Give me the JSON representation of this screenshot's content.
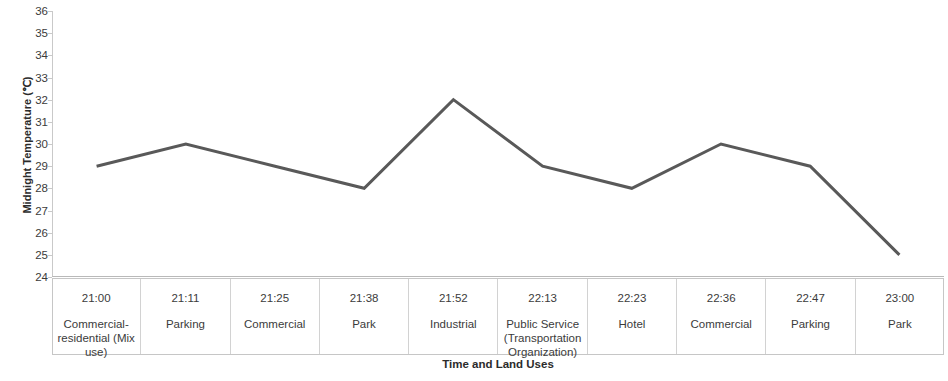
{
  "chart_data": {
    "type": "line",
    "title": "",
    "xlabel": "Time  and Land Uses",
    "ylabel": "Midnight Temperature (℃)",
    "ylim": [
      24,
      36
    ],
    "ytick_step": 1,
    "grid": false,
    "legend": "none",
    "line_color": "#595959",
    "line_width": 3,
    "categories": [
      "21:00",
      "21:11",
      "21:25",
      "21:38",
      "21:52",
      "22:13",
      "22:23",
      "22:36",
      "22:47",
      "23:00"
    ],
    "category_sublabels": [
      "Commercial-residential (Mix use)",
      "Parking",
      "Commercial",
      "Park",
      "Industrial",
      "Public Service (Transportation Organization)",
      "Hotel",
      "Commercial",
      "Parking",
      "Park"
    ],
    "values": [
      29,
      30,
      29,
      28,
      32,
      29,
      28,
      30,
      29,
      25
    ],
    "yticks": [
      "36",
      "35",
      "34",
      "33",
      "32",
      "31",
      "30",
      "29",
      "28",
      "27",
      "26",
      "25",
      "24"
    ]
  },
  "axis": {
    "y_title": "Midnight Temperature (℃)",
    "x_title": "Time  and Land Uses"
  },
  "table": {
    "rows": [
      {
        "time": "21:00",
        "land_use": "Commercial-residential (Mix use)"
      },
      {
        "time": "21:11",
        "land_use": "Parking"
      },
      {
        "time": "21:25",
        "land_use": "Commercial"
      },
      {
        "time": "21:38",
        "land_use": "Park"
      },
      {
        "time": "21:52",
        "land_use": "Industrial"
      },
      {
        "time": "22:13",
        "land_use": "Public Service (Transportation Organization)"
      },
      {
        "time": "22:23",
        "land_use": "Hotel"
      },
      {
        "time": "22:36",
        "land_use": "Commercial"
      },
      {
        "time": "22:47",
        "land_use": "Parking"
      },
      {
        "time": "23:00",
        "land_use": "Park"
      }
    ]
  }
}
